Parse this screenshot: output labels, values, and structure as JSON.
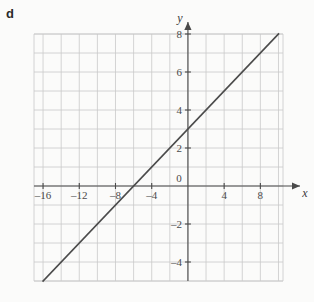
{
  "figure": {
    "part_label": "d",
    "x_axis_name": "x",
    "y_axis_name": "y"
  },
  "chart_data": {
    "type": "line",
    "title": "",
    "xlabel": "x",
    "ylabel": "y",
    "xlim": [
      -17,
      10.5
    ],
    "ylim": [
      -5,
      8
    ],
    "grid": true,
    "grid_step_x": 2,
    "grid_step_y": 1,
    "legend": "none",
    "xticks": [
      -16,
      -12,
      -8,
      -4,
      0,
      4,
      8
    ],
    "xticklabels": [
      "–16",
      "–12",
      "–8",
      "–4",
      "0",
      "4",
      "8"
    ],
    "yticks": [
      8,
      6,
      4,
      2,
      0,
      -2,
      -4
    ],
    "yticklabels": [
      "8",
      "6",
      "4",
      "2",
      "0",
      "–2",
      "–4"
    ],
    "series": [
      {
        "name": "y = x/2 + 3",
        "slope": 0.5,
        "intercept": 3,
        "x_intercept": -6,
        "y_intercept": 3,
        "x": [
          -17,
          10.5
        ],
        "values": [
          -5.5,
          8.25
        ],
        "color": "#4b4b4b"
      }
    ],
    "colors": {
      "grid": "#c9c9c9",
      "axis": "#4a4a4a",
      "line": "#4b4b4b",
      "background": "#fbfbfa",
      "text": "#4a4a4a"
    }
  }
}
